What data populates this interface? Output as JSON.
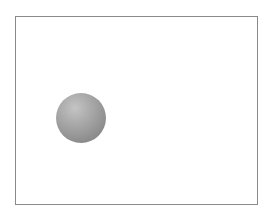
{
  "scene": {
    "description": "Gray shaded sphere inside a rectangular frame",
    "frame": {
      "border_color": "#8a8a8a",
      "background": "#ffffff"
    },
    "sphere": {
      "label": "sphere",
      "center_x": 81,
      "center_y": 118,
      "radius": 25,
      "color": "#9a9a9a"
    }
  }
}
